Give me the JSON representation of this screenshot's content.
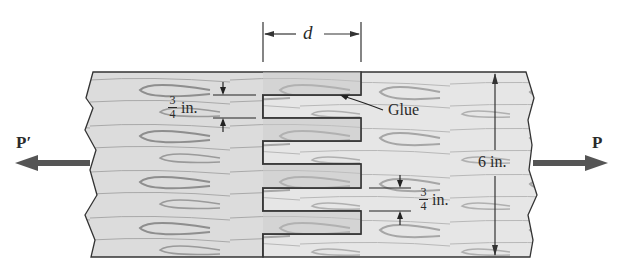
{
  "figure": {
    "type": "finger-jointed glued wood boards under axial tension",
    "colors": {
      "wood_light": "#e4e4e4",
      "wood_mid": "#d2d2d2",
      "grain": "#9a9a9a",
      "outline": "#333333",
      "arrow": "#555555",
      "text": "#2a2a2a"
    }
  },
  "labels": {
    "overlap_length": "d",
    "glue": "Glue",
    "thickness_total": "6 in.",
    "finger_width_left": {
      "numerator": "3",
      "denominator": "4",
      "unit": "in."
    },
    "finger_width_right": {
      "numerator": "3",
      "denominator": "4",
      "unit": "in."
    },
    "load_left": "P′",
    "load_right": "P"
  },
  "geometry": {
    "board_height_in": 6,
    "finger_count": 8,
    "finger_width_in": 0.75,
    "overlap_symbol": "d"
  }
}
